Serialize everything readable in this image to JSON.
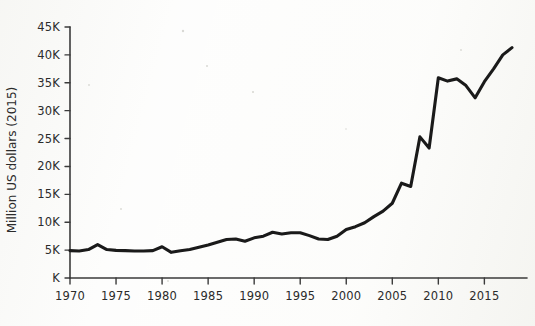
{
  "chart_data": {
    "type": "line",
    "title": "",
    "subtitle": "",
    "xlabel": "",
    "ylabel": "Million US dollars (2015)",
    "grid": false,
    "legend": false,
    "xlim": [
      1970,
      2018
    ],
    "ylim": [
      0,
      45000
    ],
    "y_tick_labels": [
      "45K",
      "40K",
      "35K",
      "30K",
      "25K",
      "20K",
      "15K",
      "10K",
      "5K",
      "K"
    ],
    "y_tick_values": [
      45000,
      40000,
      35000,
      30000,
      25000,
      20000,
      15000,
      10000,
      5000,
      0
    ],
    "x_tick_labels": [
      "1970",
      "1975",
      "1980",
      "1985",
      "1990",
      "1995",
      "2000",
      "2005",
      "2010",
      "2015"
    ],
    "x_tick_values": [
      1970,
      1975,
      1980,
      1985,
      1990,
      1995,
      2000,
      2005,
      2010,
      2015
    ],
    "series": [
      {
        "name": "Million US dollars (2015)",
        "color": "#1a1a1a",
        "x": [
          1970,
          1971,
          1972,
          1973,
          1974,
          1975,
          1976,
          1977,
          1978,
          1979,
          1980,
          1981,
          1982,
          1983,
          1984,
          1985,
          1986,
          1987,
          1988,
          1989,
          1990,
          1991,
          1992,
          1993,
          1994,
          1995,
          1996,
          1997,
          1998,
          1999,
          2000,
          2001,
          2002,
          2003,
          2004,
          2005,
          2006,
          2007,
          2008,
          2009,
          2010,
          2011,
          2012,
          2013,
          2014,
          2015,
          2016,
          2017,
          2018
        ],
        "values": [
          4900,
          4850,
          5100,
          6000,
          5100,
          4950,
          4900,
          4850,
          4850,
          4900,
          5600,
          4600,
          4900,
          5100,
          5500,
          5900,
          6400,
          6900,
          7000,
          6600,
          7200,
          7500,
          8200,
          7900,
          8100,
          8100,
          7600,
          7000,
          6900,
          7500,
          8700,
          9200,
          9900,
          11000,
          12000,
          13400,
          17000,
          16400,
          25300,
          23300,
          35900,
          35300,
          35700,
          34500,
          32300,
          35200,
          37500,
          40000,
          41300
        ]
      }
    ]
  },
  "axes": {
    "y_axis_title": "Million US dollars (2015)"
  }
}
